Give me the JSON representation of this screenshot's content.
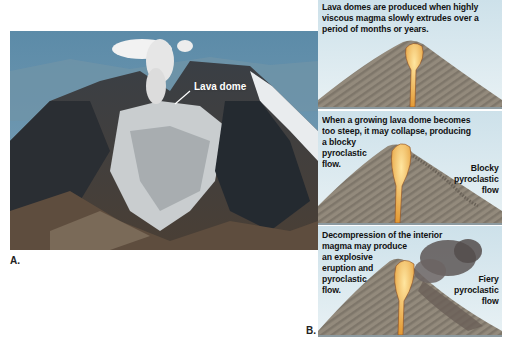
{
  "figure": {
    "part_a": {
      "label": "A.",
      "photo_annotation": "Lava dome"
    },
    "part_b": {
      "label": "B.",
      "panels": [
        {
          "caption_lines": [
            "Lava domes are produced when highly",
            "viscous magma slowly extrudes over a",
            "period of months or years."
          ]
        },
        {
          "caption_lines": [
            "When a growing lava dome becomes",
            "too steep, it may collapse, producing",
            "a blocky",
            "pyroclastic",
            "flow."
          ],
          "side_label_lines": [
            "Blocky",
            "pyroclastic",
            "flow"
          ]
        },
        {
          "caption_lines": [
            "Decompression of the interior",
            "magma may produce",
            "an explosive",
            "eruption and",
            "pyroclastic",
            "flow."
          ],
          "side_label_lines": [
            "Fiery",
            "pyroclastic",
            "flow"
          ]
        }
      ]
    },
    "colors": {
      "panel_sky": "#d4e6ed",
      "cone": "#8d8578",
      "magma": "#f2b94a",
      "text": "#111111"
    }
  }
}
